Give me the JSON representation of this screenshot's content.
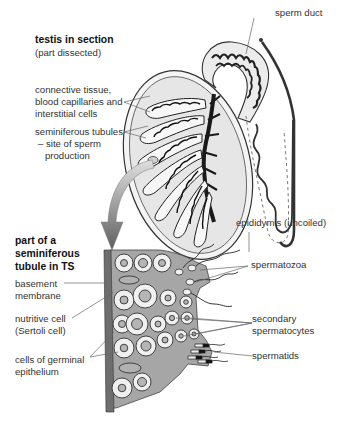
{
  "diagram": {
    "top_section": {
      "title": "testis in section",
      "subtitle": "(part dissected)",
      "labels": {
        "sperm_duct": "sperm duct",
        "connective_line1": "connective tissue,",
        "connective_line2": "blood capillaries and",
        "connective_line3": "interstitial cells",
        "tubules_line1": "seminiferous tubules",
        "tubules_line2": "– site of sperm",
        "tubules_line3": "production",
        "epididymis": "epididymis (uncoiled)"
      }
    },
    "bottom_section": {
      "title_line1": "part of a",
      "title_line2": "seminiferous",
      "title_line3": "tubule in TS",
      "labels": {
        "basement_line1": "basement",
        "basement_line2": "membrane",
        "nutritive_line1": "nutritive cell",
        "nutritive_line2": "(Sertoli cell)",
        "germinal_line1": "cells of germinal",
        "germinal_line2": "epithelium",
        "spermatozoa": "spermatozoa",
        "secondary_line1": "secondary",
        "secondary_line2": "spermatocytes",
        "spermatids": "spermatids"
      }
    },
    "colors": {
      "tissue_grey": "#a6a6a6",
      "cell_fill": "#f0f0f0",
      "membrane": "#6e6e6e",
      "outline": "#333333",
      "arrow_dark": "#6a6a6a",
      "arrow_light": "#d0d0d0"
    }
  }
}
